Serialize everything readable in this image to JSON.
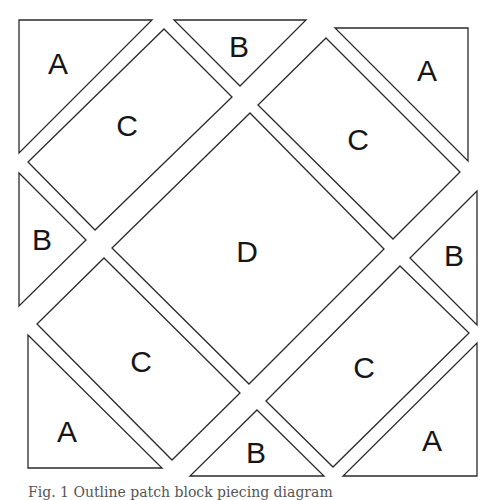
{
  "figure": {
    "caption": "Fig. 1  Outline patch block piecing diagram",
    "pieces": [
      {
        "id": "A-top-left",
        "label": "A",
        "shape": "triangle",
        "points": "19,20 152,20 19,153",
        "label_pos": [
          58,
          63
        ]
      },
      {
        "id": "B-top",
        "label": "B",
        "shape": "triangle",
        "points": "174,20 306,20 240,86",
        "label_pos": [
          239,
          46
        ]
      },
      {
        "id": "A-top-right",
        "label": "A",
        "shape": "triangle",
        "points": "335,28 468,28 468,161",
        "label_pos": [
          427,
          70
        ]
      },
      {
        "id": "C-top-left",
        "label": "C",
        "shape": "rectangle",
        "points": "164,29 232,97 95,230 28,162",
        "label_pos": [
          127,
          125
        ]
      },
      {
        "id": "C-top-right",
        "label": "C",
        "shape": "rectangle",
        "points": "326,38 460,172 393,239 258,105",
        "label_pos": [
          358,
          139
        ]
      },
      {
        "id": "B-left",
        "label": "B",
        "shape": "triangle",
        "points": "19,173 86,240 19,306",
        "label_pos": [
          42,
          239
        ]
      },
      {
        "id": "D-center",
        "label": "D",
        "shape": "square",
        "points": "250,113 384,249 249,384 112,248",
        "label_pos": [
          247,
          251
        ]
      },
      {
        "id": "B-right",
        "label": "B",
        "shape": "triangle",
        "points": "477,191 410,258 477,325",
        "label_pos": [
          454,
          255
        ]
      },
      {
        "id": "C-bottom-left",
        "label": "C",
        "shape": "rectangle",
        "points": "104,258 240,393 172,460 37,324",
        "label_pos": [
          141,
          361
        ]
      },
      {
        "id": "C-bottom-right",
        "label": "C",
        "shape": "rectangle",
        "points": "400,266 469,333 333,467 266,401",
        "label_pos": [
          364,
          367
        ]
      },
      {
        "id": "A-bottom-left",
        "label": "A",
        "shape": "triangle",
        "points": "28,335 162,468 28,468",
        "label_pos": [
          67,
          431
        ]
      },
      {
        "id": "B-bottom",
        "label": "B",
        "shape": "triangle",
        "points": "257,410 324,476 190,476",
        "label_pos": [
          256,
          452
        ]
      },
      {
        "id": "A-bottom-right",
        "label": "A",
        "shape": "triangle",
        "points": "477,343 477,476 343,476",
        "label_pos": [
          432,
          440
        ]
      }
    ],
    "colors": {
      "fill": "#ffffff",
      "stroke": "#2a2a2a",
      "label": "#161616"
    }
  }
}
